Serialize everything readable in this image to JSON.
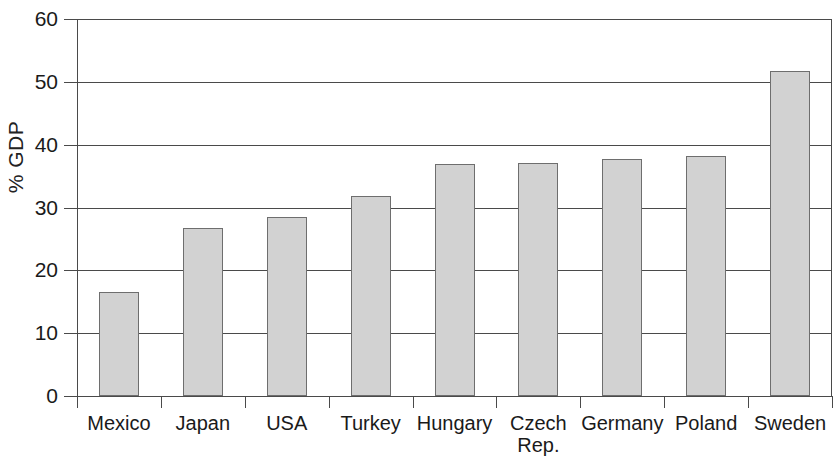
{
  "chart_data": {
    "type": "bar",
    "title": "",
    "subtitle": "",
    "xlabel": "",
    "ylabel": "% GDP",
    "categories": [
      "Mexico",
      "Japan",
      "USA",
      "Turkey",
      "Hungary",
      "Czech Rep.",
      "Germany",
      "Poland",
      "Sweden"
    ],
    "category_lines": [
      [
        "Mexico"
      ],
      [
        "Japan"
      ],
      [
        "USA"
      ],
      [
        "Turkey"
      ],
      [
        "Hungary"
      ],
      [
        "Czech",
        "Rep."
      ],
      [
        "Germany"
      ],
      [
        "Poland"
      ],
      [
        "Sweden"
      ]
    ],
    "values": [
      16.5,
      26.7,
      28.5,
      31.8,
      37.0,
      37.1,
      37.7,
      38.2,
      51.7
    ],
    "ylim": [
      0,
      60
    ],
    "ytick_labels": [
      "0",
      "10",
      "20",
      "30",
      "40",
      "50",
      "60"
    ],
    "yticks": [
      0,
      10,
      20,
      30,
      40,
      50,
      60
    ],
    "grid": true,
    "grid_axis": "y",
    "legend": false,
    "legend_position": "none",
    "bar_fill_color": "#d2d2d2",
    "bar_border_color": "#6e6e6e",
    "axis_color": "#4a4a4a",
    "background_color": "#ffffff"
  }
}
